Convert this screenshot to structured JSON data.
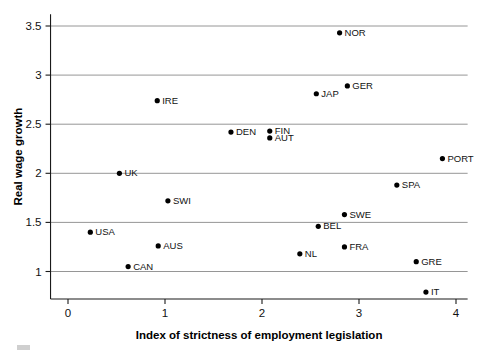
{
  "chart_data": {
    "type": "scatter",
    "title": "",
    "xlabel": "Index of strictness of employment legislation",
    "ylabel": "Real wage growth",
    "xlim": [
      -0.18,
      4.12
    ],
    "ylim": [
      0.72,
      3.62
    ],
    "xticks": [
      "0",
      "1",
      "2",
      "3",
      "4"
    ],
    "xtick_values": [
      0,
      1,
      2,
      3,
      4
    ],
    "yticks": [
      "1",
      "1.5",
      "2",
      "2.5",
      "3",
      "3.5"
    ],
    "ytick_values": [
      1,
      1.5,
      2,
      2.5,
      3,
      3.5
    ],
    "grid": "horizontal",
    "legend": "none",
    "points": [
      {
        "label": "NOR",
        "x": 2.8,
        "y": 3.43,
        "label_dx": 5,
        "label_dy": 3
      },
      {
        "label": "GER",
        "x": 2.88,
        "y": 2.89,
        "label_dx": 5,
        "label_dy": 3
      },
      {
        "label": "JAP",
        "x": 2.56,
        "y": 2.81,
        "label_dx": 5,
        "label_dy": 3
      },
      {
        "label": "IRE",
        "x": 0.92,
        "y": 2.74,
        "label_dx": 5,
        "label_dy": 3
      },
      {
        "label": "DEN",
        "x": 1.68,
        "y": 2.42,
        "label_dx": 5,
        "label_dy": 3
      },
      {
        "label": "FIN",
        "x": 2.08,
        "y": 2.43,
        "label_dx": 5,
        "label_dy": 3
      },
      {
        "label": "AUT",
        "x": 2.08,
        "y": 2.36,
        "label_dx": 5,
        "label_dy": 3
      },
      {
        "label": "PORT",
        "x": 3.86,
        "y": 2.15,
        "label_dx": 5,
        "label_dy": 3
      },
      {
        "label": "UK",
        "x": 0.53,
        "y": 2.0,
        "label_dx": 5,
        "label_dy": 3
      },
      {
        "label": "SPA",
        "x": 3.39,
        "y": 1.88,
        "label_dx": 5,
        "label_dy": 3
      },
      {
        "label": "SWI",
        "x": 1.03,
        "y": 1.72,
        "label_dx": 5,
        "label_dy": 3
      },
      {
        "label": "SWE",
        "x": 2.85,
        "y": 1.58,
        "label_dx": 5,
        "label_dy": 3
      },
      {
        "label": "BEL",
        "x": 2.58,
        "y": 1.46,
        "label_dx": 5,
        "label_dy": 3
      },
      {
        "label": "USA",
        "x": 0.23,
        "y": 1.4,
        "label_dx": 5,
        "label_dy": 3
      },
      {
        "label": "AUS",
        "x": 0.93,
        "y": 1.26,
        "label_dx": 5,
        "label_dy": 3
      },
      {
        "label": "FRA",
        "x": 2.85,
        "y": 1.25,
        "label_dx": 5,
        "label_dy": 3
      },
      {
        "label": "NL",
        "x": 2.39,
        "y": 1.18,
        "label_dx": 5,
        "label_dy": 3
      },
      {
        "label": "GRE",
        "x": 3.59,
        "y": 1.1,
        "label_dx": 5,
        "label_dy": 3
      },
      {
        "label": "CAN",
        "x": 0.62,
        "y": 1.05,
        "label_dx": 5,
        "label_dy": 3
      },
      {
        "label": "IT",
        "x": 3.69,
        "y": 0.79,
        "label_dx": 5,
        "label_dy": 3
      }
    ],
    "colors": {
      "point": "#000000",
      "grid": "#8a8a8a",
      "axis": "#1a1a1a",
      "text": "#111111",
      "background": "#ffffff"
    }
  }
}
